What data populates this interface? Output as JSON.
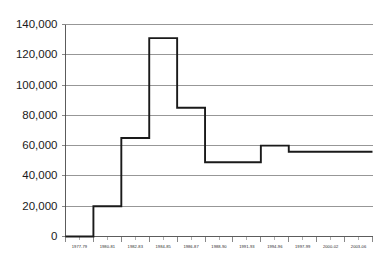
{
  "chart_data": {
    "type": "line",
    "title": "",
    "subtitle": "",
    "xlabel": "",
    "ylabel": "",
    "step": "post",
    "grid": true,
    "legend": false,
    "ylim": [
      0,
      140000
    ],
    "ytick_labels": [
      "140,000",
      "120,000",
      "100,000",
      "80,000",
      "60,000",
      "40,000",
      "20,000",
      "0"
    ],
    "ytick_values": [
      140000,
      120000,
      100000,
      80000,
      60000,
      40000,
      20000,
      0
    ],
    "categories": [
      "1977-79",
      "1980-81",
      "1982-83",
      "1984-85",
      "1986-87",
      "1988-90",
      "1991-93",
      "1994-96",
      "1997-99",
      "2000-02",
      "2003-06"
    ],
    "values": [
      0,
      20000,
      65000,
      131000,
      85000,
      49000,
      49000,
      60000,
      56000,
      56000,
      56000
    ],
    "series": [
      {
        "name": "",
        "values": [
          0,
          20000,
          65000,
          131000,
          85000,
          49000,
          49000,
          60000,
          56000,
          56000,
          56000
        ]
      }
    ],
    "annotations": []
  }
}
